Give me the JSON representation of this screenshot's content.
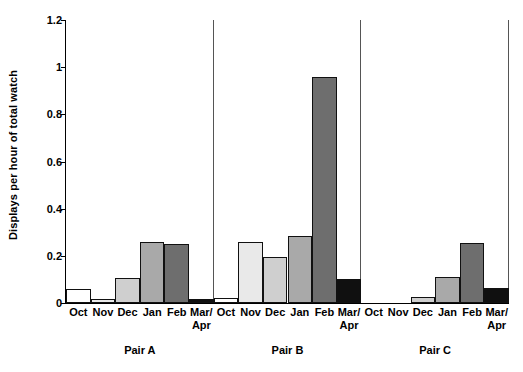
{
  "chart_data": {
    "type": "bar",
    "title": "",
    "xlabel": "",
    "ylabel": "Displays per hour of total watch",
    "ylim": [
      0,
      1.2
    ],
    "ytick_labels": [
      "0",
      "0.2",
      "0.4",
      "0.6",
      "0.8",
      "1",
      "1.2"
    ],
    "ytick_values": [
      0,
      0.2,
      0.4,
      0.6,
      0.8,
      1.0,
      1.2
    ],
    "grid": false,
    "legend": "none",
    "categories": [
      "Oct",
      "Nov",
      "Dec",
      "Jan",
      "Feb",
      "Mar/\nApr"
    ],
    "category_labels": [
      {
        "line1": "Oct",
        "line2": ""
      },
      {
        "line1": "Nov",
        "line2": ""
      },
      {
        "line1": "Dec",
        "line2": ""
      },
      {
        "line1": "Jan",
        "line2": ""
      },
      {
        "line1": "Feb",
        "line2": ""
      },
      {
        "line1": "Mar/",
        "line2": "Apr"
      }
    ],
    "groups": [
      {
        "name": "Pair A",
        "values": [
          0.06,
          0.015,
          0.105,
          0.26,
          0.25,
          0.015
        ]
      },
      {
        "name": "Pair B",
        "values": [
          0.02,
          0.26,
          0.195,
          0.283,
          0.96,
          0.1
        ]
      },
      {
        "name": "Pair C",
        "values": [
          0.0,
          0.0,
          0.025,
          0.11,
          0.255,
          0.065
        ]
      }
    ],
    "bar_colors": [
      "#ffffff",
      "#e9e9e9",
      "#cfcfcf",
      "#a9a9a9",
      "#6e6e6e",
      "#101010"
    ],
    "bar_edge_color": "#111111",
    "axis_color": "#000000",
    "separator_color": "#555555",
    "background": "#ffffff"
  }
}
